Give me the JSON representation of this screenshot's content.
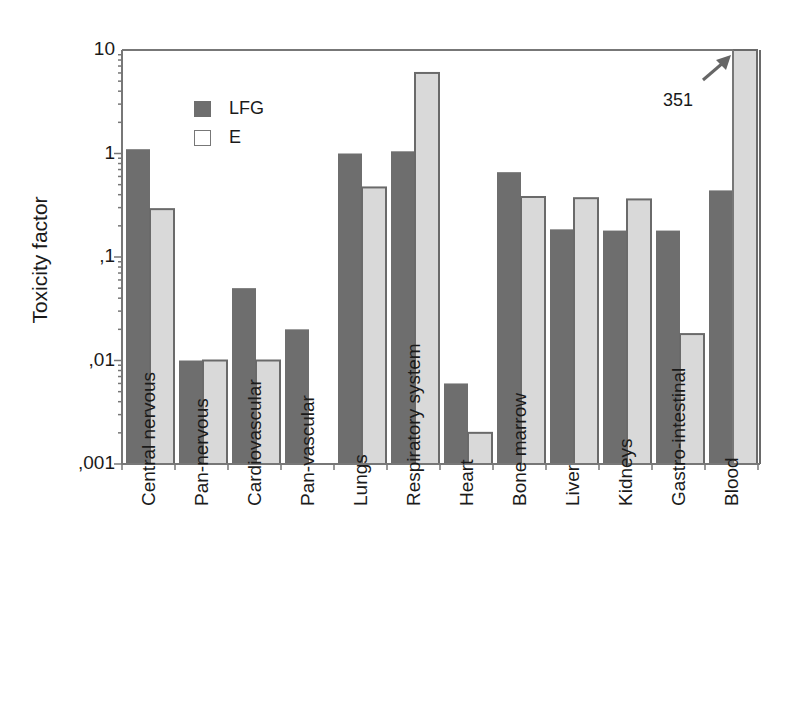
{
  "chart_data": {
    "type": "bar",
    "title": "",
    "xlabel": "",
    "ylabel": "Toxicity factor",
    "yscale": "log",
    "ylim": [
      0.001,
      10
    ],
    "yticks": [
      0.001,
      0.01,
      0.1,
      1,
      10
    ],
    "ytick_labels": [
      ",001",
      ",01",
      ",1",
      "1",
      "10"
    ],
    "grid": false,
    "legend_position": "upper left (inside)",
    "categories": [
      "Central nervous",
      "Pan-nervous",
      "Cardiovascular",
      "Pan-vascular",
      "Lungs",
      "Respiratory system",
      "Heart",
      "Bone marrow",
      "Liver",
      "Kidneys",
      "Gastro-intestinal",
      "Blood"
    ],
    "series": [
      {
        "name": "LFG",
        "color": "#6e6e6e",
        "values": [
          1.1,
          0.01,
          0.05,
          0.02,
          1.0,
          1.05,
          0.006,
          0.66,
          0.185,
          0.18,
          0.18,
          0.44
        ]
      },
      {
        "name": "E",
        "color": "#d9d9d9",
        "values": [
          0.29,
          0.01,
          0.01,
          null,
          0.47,
          6.0,
          0.002,
          0.38,
          0.37,
          0.36,
          0.018,
          351
        ]
      }
    ],
    "annotations": [
      {
        "text": "351",
        "target": "Blood / E (off-scale, arrow)"
      }
    ]
  },
  "labels": {
    "ylabel": "Toxicity factor",
    "annotation": "351",
    "legend": [
      "LFG",
      "E"
    ]
  }
}
